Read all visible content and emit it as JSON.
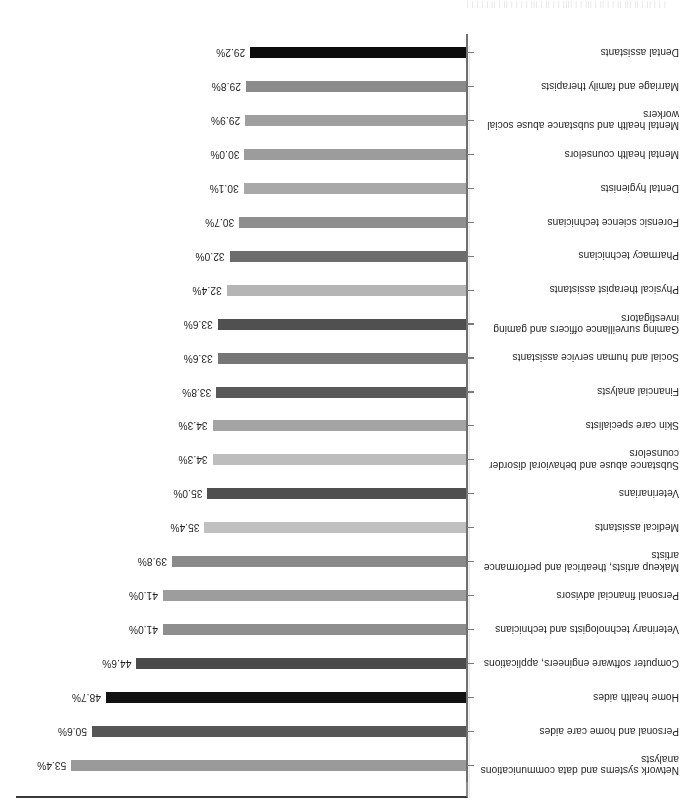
{
  "page": {
    "bleed_text": "  | |  | ||  |  ||   ||| ||   | |  ||  | |||  |  |  |||| | | ||  |  |||  |  |  | | ||  |  ||   | |   |  | |"
  },
  "chart_data": {
    "type": "bar",
    "orientation": "horizontal",
    "title": "",
    "subtitle": "",
    "xlabel": "",
    "ylabel": "",
    "xlim": [
      0,
      60
    ],
    "grid": false,
    "legend": "none",
    "value_label_format": "percent-one-decimal",
    "categories": [
      "Network systems and data communications analysts",
      "Personal and home care aides",
      "Home health aides",
      "Computer software engineers, applications",
      "Veterinary technologists and technicians",
      "Personal financial advisors",
      "Makeup artists, theatrical and performance artists",
      "Medical assistants",
      "Veterinarians",
      "Substance abuse and behavioral disorder counselors",
      "Skin care specialists",
      "Financial analysts",
      "Social and human service assistants",
      "Gaming surveillance officers and gaming investigators",
      "Physical therapist assistants",
      "Pharmacy technicians",
      "Forensic science technicians",
      "Dental hygienists",
      "Mental health counselors",
      "Mental health and substance abuse social workers",
      "Marriage and family therapists",
      "Dental assistants"
    ],
    "category_lines": [
      [
        "Network systems and data communications",
        "analysts"
      ],
      [
        "Personal and home care aides"
      ],
      [
        "Home health aides"
      ],
      [
        "Computer software engineers, applications"
      ],
      [
        "Veterinary technologists and technicians"
      ],
      [
        "Personal financial advisors"
      ],
      [
        "Makeup artists, theatrical and performance",
        "artists"
      ],
      [
        "Medical assistants"
      ],
      [
        "Veterinarians"
      ],
      [
        "Substance abuse and behavioral disorder",
        "counselors"
      ],
      [
        "Skin care specialists"
      ],
      [
        "Financial analysts"
      ],
      [
        "Social and human service assistants"
      ],
      [
        "Gaming surveillance officers and gaming",
        "investigators"
      ],
      [
        "Physical therapist assistants"
      ],
      [
        "Pharmacy technicians"
      ],
      [
        "Forensic science technicians"
      ],
      [
        "Dental hygienists"
      ],
      [
        "Mental health counselors"
      ],
      [
        "Mental health and substance abuse social",
        "workers"
      ],
      [
        "Marriage and family therapists"
      ],
      [
        "Dental assistants"
      ]
    ],
    "values": [
      53.4,
      50.6,
      48.7,
      44.6,
      41.0,
      41.0,
      39.8,
      35.4,
      35.0,
      34.3,
      34.3,
      33.8,
      33.6,
      33.6,
      32.4,
      32.0,
      30.7,
      30.1,
      30.0,
      29.9,
      29.8,
      29.2
    ],
    "value_labels": [
      "53.4%",
      "50.6%",
      "48.7%",
      "44.6%",
      "41.0%",
      "41.0%",
      "39.8%",
      "35.4%",
      "35.0%",
      "34.3%",
      "34.3%",
      "33.8%",
      "33.6%",
      "33.6%",
      "32.4%",
      "32.0%",
      "30.7%",
      "30.1%",
      "30.0%",
      "29.9%",
      "29.8%",
      "29.2%"
    ],
    "bar_colors": [
      "#9a9a9a",
      "#565656",
      "#111111",
      "#4a4a4a",
      "#8e8e8e",
      "#9d9d9d",
      "#8a8a8a",
      "#c0c0c0",
      "#4f4f4f",
      "#bdbdbd",
      "#a4a4a4",
      "#595959",
      "#767676",
      "#505050",
      "#b5b5b5",
      "#6c6c6c",
      "#8f8f8f",
      "#a8a8a8",
      "#9c9c9c",
      "#9f9f9f",
      "#8b8b8b",
      "#0d0d0d"
    ]
  }
}
